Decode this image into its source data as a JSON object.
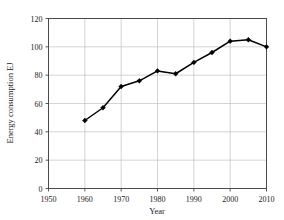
{
  "chart_data": {
    "type": "line",
    "title": "",
    "xlabel": "Year",
    "ylabel": "Energy consumption EJ",
    "xlim": [
      1950,
      2010
    ],
    "ylim": [
      0,
      120
    ],
    "xticks": [
      1950,
      1960,
      1970,
      1980,
      1990,
      2000,
      2010
    ],
    "yticks": [
      0,
      20,
      40,
      60,
      80,
      100,
      120
    ],
    "xtick_labels": [
      "1950",
      "1960",
      "1970",
      "1980",
      "1990",
      "2000",
      "2010"
    ],
    "ytick_labels": [
      "0",
      "20",
      "40",
      "60",
      "80",
      "100",
      "120"
    ],
    "grid": true,
    "legend": "none",
    "marker": "filled-diamond",
    "line_color": "#000000",
    "grid_color": "#b9b9b9",
    "frame_color": "#4a4a4a",
    "background": "#ffffff",
    "x": [
      1960,
      1965,
      1970,
      1975,
      1980,
      1985,
      1990,
      1995,
      2000,
      2005,
      2010
    ],
    "values": [
      48,
      57,
      72,
      76,
      83,
      81,
      89,
      96,
      104,
      105,
      100
    ],
    "series": [
      {
        "name": "Energy consumption",
        "x": [
          1960,
          1965,
          1970,
          1975,
          1980,
          1985,
          1990,
          1995,
          2000,
          2005,
          2010
        ],
        "values": [
          48,
          57,
          72,
          76,
          83,
          81,
          89,
          96,
          104,
          105,
          100
        ]
      }
    ]
  },
  "figure": {
    "faint_header": ""
  }
}
